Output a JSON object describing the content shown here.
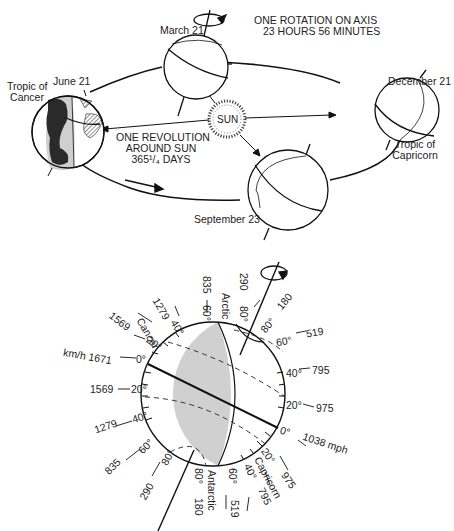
{
  "orbit_diagram": {
    "rotation_label_line1": "ONE ROTATION ON AXIS",
    "rotation_label_line2": "23 HOURS 56 MINUTES",
    "revolution_label_line1": "ONE REVOLUTION",
    "revolution_label_line2": "AROUND SUN",
    "revolution_label_line3": "365¹/₄ DAYS",
    "sun_label": "SUN",
    "dates": {
      "march": "March 21",
      "june": "June 21",
      "september": "September 23",
      "december": "December 21"
    },
    "tropic_cancer_line1": "Tropic of",
    "tropic_cancer_line2": "Cancer",
    "tropic_capricorn_line1": "Tropic of",
    "tropic_capricorn_line2": "Capricorn"
  },
  "rotation_speed_diagram": {
    "unit_kmh": "km/h",
    "unit_mph": "mph",
    "left_labels": [
      {
        "lat": "0°",
        "speed": "km/h 1671"
      },
      {
        "lat": "20°",
        "speed": "1569"
      },
      {
        "lat": "40°",
        "speed": "1279"
      },
      {
        "lat": "60°",
        "speed": "835"
      },
      {
        "lat": "80°",
        "speed": "290"
      }
    ],
    "upper_left_labels": [
      {
        "lat": "20°",
        "speed": "1569",
        "note": "Cancer"
      },
      {
        "lat": "40°",
        "speed": "1279"
      },
      {
        "lat": "60°",
        "speed": "835",
        "note": "Arctic"
      },
      {
        "lat": "80°",
        "speed": "290"
      }
    ],
    "right_labels": [
      {
        "lat": "80°",
        "speed": "180"
      },
      {
        "lat": "60°",
        "speed": "519"
      },
      {
        "lat": "40°",
        "speed": "795"
      },
      {
        "lat": "20°",
        "speed": "975"
      },
      {
        "lat": "0°",
        "speed": "1038 mph"
      }
    ],
    "lower_right_labels": [
      {
        "lat": "20°",
        "speed": "975",
        "note": "Capricorn"
      },
      {
        "lat": "40°",
        "speed": "795"
      },
      {
        "lat": "60°",
        "speed": "519",
        "note": "Antarctic"
      },
      {
        "lat": "80°",
        "speed": "180"
      }
    ],
    "notes": {
      "cancer": "Cancer",
      "arctic": "Arctic",
      "capricorn": "Capricorn",
      "antarctic": "Antarctic"
    }
  }
}
